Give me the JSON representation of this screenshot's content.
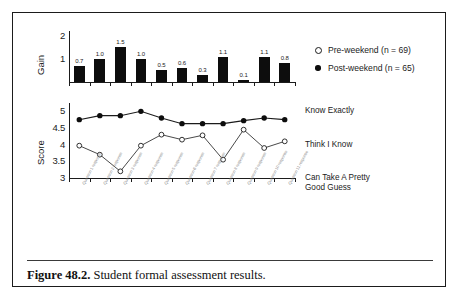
{
  "figure": {
    "caption_label": "Figure 48.2.",
    "caption_text": "Student formal assessment results."
  },
  "legend": {
    "items": [
      {
        "label": "Pre-weekend (n = 69)",
        "marker": "open-circle"
      },
      {
        "label": "Post-weekend (n = 65)",
        "marker": "filled-circle"
      }
    ]
  },
  "chart_data": [
    {
      "type": "bar",
      "title": "",
      "ylabel": "Gain",
      "xlabel": "",
      "ylim": [
        0,
        2.2
      ],
      "yticks": [
        1,
        2
      ],
      "ytick_labels": [
        "1",
        "2"
      ],
      "grid": false,
      "categories": [
        "Q1",
        "Q2",
        "Q3",
        "Q4",
        "Q5",
        "Q6",
        "Q7",
        "Q8",
        "Q9",
        "Q10",
        "Q11"
      ],
      "values": [
        0.7,
        1.0,
        1.5,
        1.0,
        0.5,
        0.6,
        0.3,
        1.1,
        0.1,
        1.1,
        0.8
      ],
      "data_labels": [
        "0.7",
        "1.0",
        "1.5",
        "1.0",
        "0.5",
        "0.6",
        "0.3",
        "1.1",
        "0.1",
        "1.1",
        "0.8"
      ],
      "bar_color": "#0d0d0d"
    },
    {
      "type": "line",
      "title": "",
      "ylabel": "Score",
      "xlabel": "",
      "ylim": [
        3,
        5.25
      ],
      "yticks": [
        3,
        3.5,
        4,
        4.5,
        5
      ],
      "ytick_labels": [
        "3",
        "3.5",
        "4",
        "4.5",
        "5"
      ],
      "grid": false,
      "categories": [
        "Q1",
        "Q2",
        "Q3",
        "Q4",
        "Q5",
        "Q6",
        "Q7",
        "Q8",
        "Q9",
        "Q10",
        "Q11"
      ],
      "right_axis_labels": [
        {
          "value": 5,
          "text": "Know Exactly"
        },
        {
          "value": 4,
          "text": "Think I Know"
        },
        {
          "value": 3,
          "text": "Can Take A Pretty\nGood Guess"
        }
      ],
      "series": [
        {
          "name": "Post-weekend (n = 65)",
          "marker": "filled-circle",
          "values": [
            4.75,
            4.87,
            4.87,
            5.0,
            4.8,
            4.63,
            4.63,
            4.63,
            4.72,
            4.8,
            4.75
          ]
        },
        {
          "name": "Pre-weekend (n = 69)",
          "marker": "open-circle",
          "values": [
            3.97,
            3.7,
            3.2,
            3.97,
            4.3,
            4.15,
            4.28,
            3.55,
            4.45,
            3.9,
            4.1
          ]
        }
      ]
    }
  ],
  "xcat_labels": [
    "Question 1 response",
    "Question 2 response",
    "Question 3 response",
    "Question 4 response",
    "Question 5 response",
    "Question 6 response",
    "Question 7 response",
    "Question 8 response",
    "Question 9 response",
    "Question 10 response",
    "Question 11 response"
  ]
}
